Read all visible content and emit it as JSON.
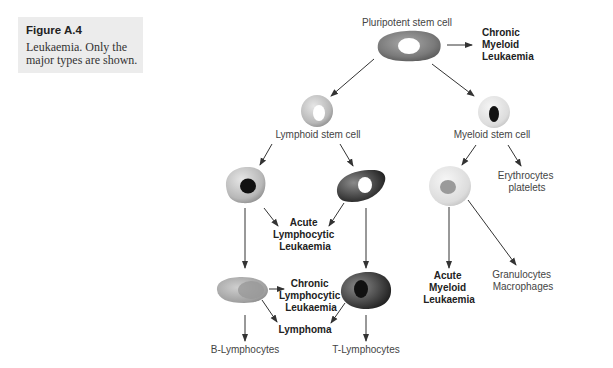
{
  "caption": {
    "title": "Figure A.4",
    "text": "Leukaemia. Only the major types are shown."
  },
  "cells": {
    "pluripotent": {
      "label": "Pluripotent stem cell"
    },
    "lymphoid": {
      "label": "Lymphoid stem cell"
    },
    "myeloid": {
      "label": "Myeloid stem cell"
    },
    "b_precursor": {
      "label": ""
    },
    "t_precursor": {
      "label": ""
    },
    "myeloid_precursor": {
      "label": ""
    },
    "b_cell": {
      "label": ""
    },
    "t_cell": {
      "label": ""
    }
  },
  "outcomes": {
    "cml": [
      "Chronic",
      "Myeloid",
      "Leukaemia"
    ],
    "all": [
      "Acute",
      "Lymphocytic",
      "Leukaemia"
    ],
    "cll": [
      "Chronic",
      "Lymphocytic",
      "Leukaemia"
    ],
    "lymphoma": "Lymphoma",
    "aml": [
      "Acute",
      "Myeloid",
      "Leukaemia"
    ],
    "erythro": [
      "Erythrocytes",
      "platelets"
    ],
    "granulo": [
      "Granulocytes",
      "Macrophages"
    ],
    "b_lymph": "B-Lymphocytes",
    "t_lymph": "T-Lymphocytes"
  },
  "colors": {
    "caption_bg": "#ececec",
    "arrow": "#333333",
    "nucleus_dark": "#111111",
    "nucleus_light": "#ffffff"
  }
}
